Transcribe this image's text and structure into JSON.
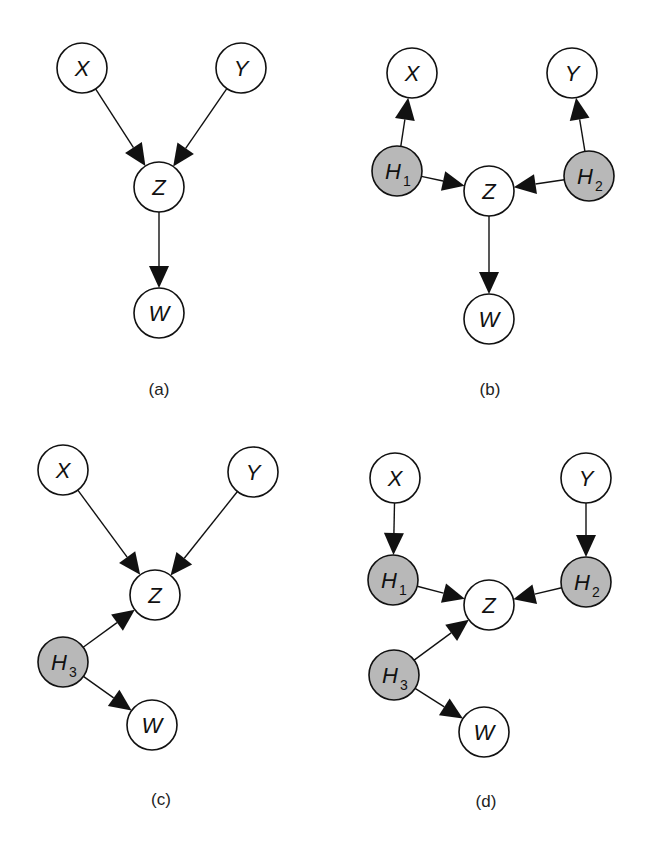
{
  "colors": {
    "observed": "#ffffff",
    "hidden": "#b8b8b8",
    "stroke": "#111111"
  },
  "panels": [
    {
      "label": "(a)",
      "label_pos": [
        159,
        389
      ],
      "nodes": [
        {
          "id": "X",
          "text": "X",
          "sub": "",
          "x": 82,
          "y": 68,
          "hidden": false
        },
        {
          "id": "Y",
          "text": "Y",
          "sub": "",
          "x": 241,
          "y": 68,
          "hidden": false
        },
        {
          "id": "Z",
          "text": "Z",
          "sub": "",
          "x": 159,
          "y": 187,
          "hidden": false
        },
        {
          "id": "W",
          "text": "W",
          "sub": "",
          "x": 159,
          "y": 313,
          "hidden": false
        }
      ],
      "edges": [
        [
          "X",
          "Z"
        ],
        [
          "Y",
          "Z"
        ],
        [
          "Z",
          "W"
        ]
      ]
    },
    {
      "label": "(b)",
      "label_pos": [
        490,
        389
      ],
      "nodes": [
        {
          "id": "X",
          "text": "X",
          "sub": "",
          "x": 412,
          "y": 73,
          "hidden": false
        },
        {
          "id": "Y",
          "text": "Y",
          "sub": "",
          "x": 572,
          "y": 73,
          "hidden": false
        },
        {
          "id": "H1",
          "text": "H",
          "sub": "1",
          "x": 397,
          "y": 171,
          "hidden": true
        },
        {
          "id": "H2",
          "text": "H",
          "sub": "2",
          "x": 589,
          "y": 176,
          "hidden": true
        },
        {
          "id": "Z",
          "text": "Z",
          "sub": "",
          "x": 489,
          "y": 191,
          "hidden": false
        },
        {
          "id": "W",
          "text": "W",
          "sub": "",
          "x": 489,
          "y": 319,
          "hidden": false
        }
      ],
      "edges": [
        [
          "H1",
          "X"
        ],
        [
          "H2",
          "Y"
        ],
        [
          "H1",
          "Z"
        ],
        [
          "H2",
          "Z"
        ],
        [
          "Z",
          "W"
        ]
      ]
    },
    {
      "label": "(c)",
      "label_pos": [
        161,
        799
      ],
      "nodes": [
        {
          "id": "X",
          "text": "X",
          "sub": "",
          "x": 63,
          "y": 470,
          "hidden": false
        },
        {
          "id": "Y",
          "text": "Y",
          "sub": "",
          "x": 253,
          "y": 472,
          "hidden": false
        },
        {
          "id": "Z",
          "text": "Z",
          "sub": "",
          "x": 155,
          "y": 595,
          "hidden": false
        },
        {
          "id": "H3",
          "text": "H",
          "sub": "3",
          "x": 63,
          "y": 662,
          "hidden": true
        },
        {
          "id": "W",
          "text": "W",
          "sub": "",
          "x": 152,
          "y": 725,
          "hidden": false
        }
      ],
      "edges": [
        [
          "X",
          "Z"
        ],
        [
          "Y",
          "Z"
        ],
        [
          "H3",
          "Z"
        ],
        [
          "H3",
          "W"
        ]
      ]
    },
    {
      "label": "(d)",
      "label_pos": [
        486,
        801
      ],
      "nodes": [
        {
          "id": "X",
          "text": "X",
          "sub": "",
          "x": 395,
          "y": 478,
          "hidden": false
        },
        {
          "id": "Y",
          "text": "Y",
          "sub": "",
          "x": 586,
          "y": 478,
          "hidden": false
        },
        {
          "id": "H1",
          "text": "H",
          "sub": "1",
          "x": 393,
          "y": 580,
          "hidden": true
        },
        {
          "id": "H2",
          "text": "H",
          "sub": "2",
          "x": 586,
          "y": 582,
          "hidden": true
        },
        {
          "id": "Z",
          "text": "Z",
          "sub": "",
          "x": 489,
          "y": 605,
          "hidden": false
        },
        {
          "id": "H3",
          "text": "H",
          "sub": "3",
          "x": 394,
          "y": 675,
          "hidden": true
        },
        {
          "id": "W",
          "text": "W",
          "sub": "",
          "x": 484,
          "y": 732,
          "hidden": false
        }
      ],
      "edges": [
        [
          "X",
          "H1"
        ],
        [
          "Y",
          "H2"
        ],
        [
          "H1",
          "Z"
        ],
        [
          "H2",
          "Z"
        ],
        [
          "H3",
          "Z"
        ],
        [
          "H3",
          "W"
        ]
      ]
    }
  ]
}
